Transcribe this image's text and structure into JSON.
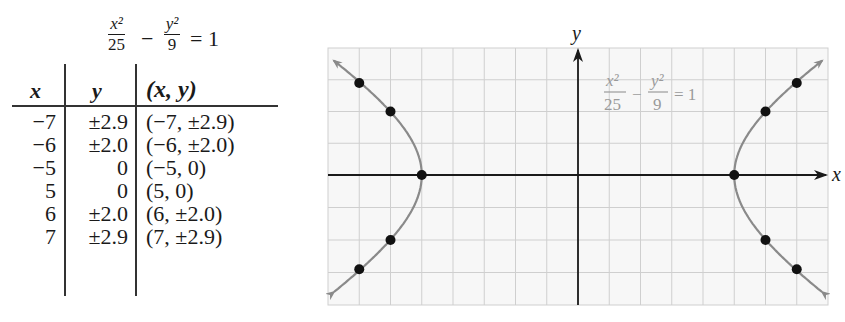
{
  "equation": {
    "x_num": "x²",
    "x_den": "25",
    "minus": "−",
    "y_num": "y²",
    "y_den": "9",
    "equals": "= 1"
  },
  "table": {
    "headers": [
      "x",
      "y",
      "(x,  y)"
    ],
    "rows": [
      {
        "x": "−7",
        "y": "±2.9",
        "xy": "(−7, ±2.9)"
      },
      {
        "x": "−6",
        "y": "±2.0",
        "xy": "(−6, ±2.0)"
      },
      {
        "x": "−5",
        "y": "0",
        "xy": "(−5, 0)"
      },
      {
        "x": "5",
        "y": "0",
        "xy": "(5, 0)"
      },
      {
        "x": "6",
        "y": "±2.0",
        "xy": "(6, ±2.0)"
      },
      {
        "x": "7",
        "y": "±2.9",
        "xy": "(7, ±2.9)"
      }
    ]
  },
  "graph": {
    "x_axis_label": "x",
    "y_axis_label": "y",
    "curve_label": {
      "x_num": "x²",
      "x_den": "25",
      "minus": "−",
      "y_num": "y²",
      "y_den": "9",
      "equals": "= 1"
    }
  },
  "chart_data": {
    "type": "scatter",
    "xlabel": "x",
    "ylabel": "y",
    "xlim": [
      -8,
      8
    ],
    "ylim": [
      -4,
      4
    ],
    "grid": true,
    "curve": "hyperbola x²/25 − y²/9 = 1 (two branches, arrows at ends)",
    "points": [
      {
        "x": -7,
        "y": 2.9
      },
      {
        "x": -7,
        "y": -2.9
      },
      {
        "x": -6,
        "y": 2.0
      },
      {
        "x": -6,
        "y": -2.0
      },
      {
        "x": -5,
        "y": 0
      },
      {
        "x": 5,
        "y": 0
      },
      {
        "x": 6,
        "y": 2.0
      },
      {
        "x": 6,
        "y": -2.0
      },
      {
        "x": 7,
        "y": 2.9
      },
      {
        "x": 7,
        "y": -2.9
      }
    ],
    "annotations": [
      "x²/25 − y²/9 = 1"
    ]
  }
}
